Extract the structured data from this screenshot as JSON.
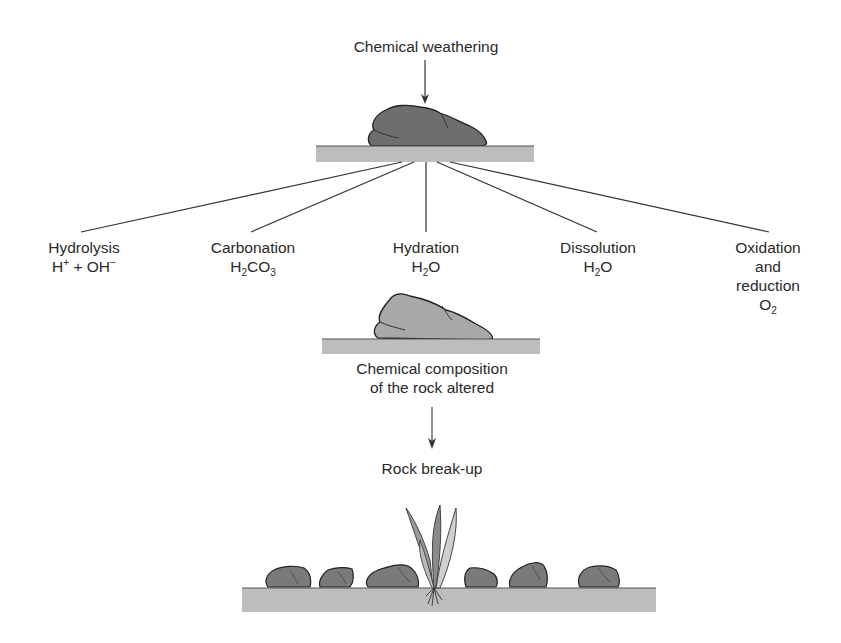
{
  "diagram": {
    "title": "Chemical weathering",
    "processes": [
      {
        "name": "Hydrolysis",
        "formula_parts": [
          "H",
          "+",
          " + OH",
          "−"
        ],
        "formula_text": "H⁺ + OH⁻"
      },
      {
        "name": "Carbonation",
        "formula_text": "H₂CO₃"
      },
      {
        "name": "Hydration",
        "formula_text": "H₂O"
      },
      {
        "name": "Dissolution",
        "formula_text": "H₂O"
      },
      {
        "name": "Oxidation",
        "name_line2": "and",
        "name_line3": "reduction",
        "formula_text": "O₂"
      }
    ],
    "result_line1": "Chemical composition",
    "result_line2": "of the rock altered",
    "outcome": "Rock break-up",
    "colors": {
      "rock_dark": "#6e6e6e",
      "rock_light": "#a8a8a8",
      "ground": "#bdbdbd",
      "line": "#333333"
    }
  }
}
